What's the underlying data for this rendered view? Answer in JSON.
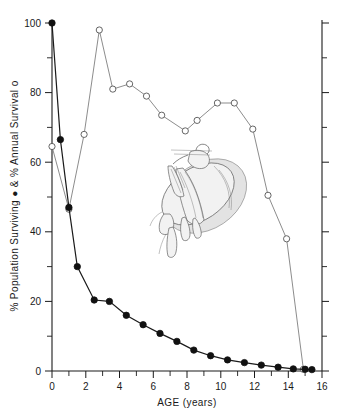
{
  "chart_data": {
    "type": "line",
    "title": "",
    "xlabel": "AGE  (years)",
    "ylabel": "% Population Surviving ●  &  % Annual Survival o",
    "ylabel_parts": {
      "pop": "% Population Surviving",
      "filled_marker": "●",
      "amp": "&",
      "ann": "% Annual Survival",
      "open_marker": "o"
    },
    "xlim": [
      0,
      16
    ],
    "ylim": [
      0,
      100
    ],
    "xticks": [
      0,
      2,
      4,
      6,
      8,
      10,
      12,
      14,
      16
    ],
    "xticklabels": [
      "0",
      "2",
      "4",
      "6",
      "8",
      "10",
      "12",
      "14",
      "16"
    ],
    "xticks_minor": [
      1,
      3,
      5,
      7,
      9,
      11,
      13,
      15
    ],
    "yticks": [
      0,
      20,
      40,
      60,
      80,
      100
    ],
    "yticklabels": [
      "0",
      "20",
      "40",
      "60",
      "80",
      "100"
    ],
    "yticks_minor": [
      10,
      30,
      50,
      70,
      90
    ],
    "grid": false,
    "legend_position": "axis-label",
    "series": [
      {
        "name": "% Population Surviving",
        "marker": "filled-circle",
        "x": [
          0.0,
          0.5,
          1.0,
          1.5,
          2.5,
          3.4,
          4.4,
          5.4,
          6.4,
          7.4,
          8.4,
          9.4,
          10.4,
          11.4,
          12.4,
          13.4,
          14.3,
          15.0,
          15.4
        ],
        "y": [
          100.0,
          66.5,
          47.0,
          30.0,
          20.4,
          20.0,
          16.0,
          13.3,
          10.8,
          8.5,
          6.0,
          4.4,
          3.2,
          2.4,
          1.7,
          1.1,
          0.6,
          0.5,
          0.4
        ]
      },
      {
        "name": "% Annual Survival",
        "marker": "open-circle",
        "x": [
          0.0,
          1.0,
          1.9,
          2.8,
          3.6,
          4.6,
          5.6,
          6.5,
          7.9,
          8.6,
          9.8,
          10.8,
          11.9,
          12.8,
          13.9,
          14.9
        ],
        "y": [
          64.5,
          46.5,
          68.0,
          98.0,
          81.0,
          82.5,
          79.0,
          73.5,
          69.0,
          72.0,
          77.0,
          77.0,
          69.5,
          50.5,
          38.0,
          0.5
        ]
      }
    ],
    "annotations": [
      {
        "name": "cuttlefish-illustration",
        "kind": "line-drawing",
        "subject": "cuttlefish anatomical drawing"
      }
    ]
  }
}
